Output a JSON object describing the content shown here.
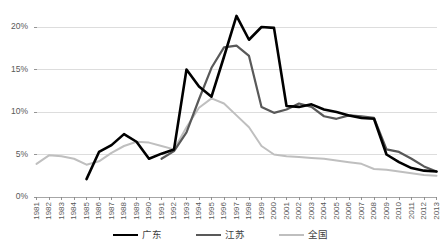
{
  "chart_data": {
    "type": "line",
    "title": "",
    "xlabel": "",
    "ylabel": "",
    "ylim": [
      0,
      21.5
    ],
    "ytick_values": [
      0,
      5,
      10,
      15,
      20
    ],
    "ytick_labels": [
      "0%",
      "5%",
      "10%",
      "15%",
      "20%"
    ],
    "grid": true,
    "legend_position": "bottom",
    "x": [
      1981,
      1982,
      1983,
      1984,
      1985,
      1986,
      1987,
      1988,
      1989,
      1990,
      1991,
      1992,
      1993,
      1994,
      1995,
      1996,
      1997,
      1998,
      1999,
      2000,
      2001,
      2002,
      2003,
      2004,
      2005,
      2006,
      2007,
      2008,
      2009,
      2010,
      2011,
      2012,
      2013
    ],
    "categories": [
      "1981",
      "1982",
      "1983",
      "1984",
      "1985",
      "1986",
      "1987",
      "1988",
      "1989",
      "1990",
      "1991",
      "1992",
      "1993",
      "1994",
      "1995",
      "1996",
      "1997",
      "1998",
      "1999",
      "2000",
      "2001",
      "2002",
      "2003",
      "2004",
      "2005",
      "2006",
      "2007",
      "2008",
      "2009",
      "2010",
      "2011",
      "2012",
      "2013"
    ],
    "series": [
      {
        "name": "广东",
        "color": "#000000",
        "width": 2.6,
        "start_index": 4,
        "values": [
          null,
          null,
          null,
          null,
          2.1,
          5.3,
          6.1,
          7.4,
          6.5,
          4.5,
          5.1,
          5.6,
          15.0,
          13.0,
          11.8,
          16.5,
          21.3,
          18.5,
          20.0,
          19.9,
          10.7,
          10.6,
          10.9,
          10.3,
          10.0,
          9.6,
          9.3,
          9.2,
          5.0,
          4.1,
          3.4,
          3.1,
          3.0
        ]
      },
      {
        "name": "江苏",
        "color": "#595959",
        "width": 2.2,
        "start_index": 10,
        "values": [
          null,
          null,
          null,
          null,
          null,
          null,
          null,
          null,
          null,
          null,
          4.5,
          5.4,
          7.6,
          11.5,
          15.2,
          17.6,
          17.8,
          16.6,
          10.6,
          9.9,
          10.3,
          11.0,
          10.6,
          9.5,
          9.2,
          9.6,
          9.5,
          9.3,
          5.6,
          5.3,
          4.5,
          3.6,
          3.0
        ]
      },
      {
        "name": "全国",
        "color": "#bfbfbf",
        "width": 2.0,
        "start_index": 0,
        "values": [
          3.9,
          4.9,
          4.8,
          4.5,
          3.8,
          4.2,
          5.2,
          6.0,
          6.5,
          6.4,
          6.0,
          5.6,
          8.2,
          10.5,
          11.6,
          11.0,
          9.6,
          8.2,
          6.0,
          5.0,
          4.8,
          4.7,
          4.6,
          4.5,
          4.3,
          4.1,
          3.9,
          3.3,
          3.2,
          3.0,
          2.8,
          2.6,
          2.5
        ]
      }
    ]
  },
  "legend": {
    "items": [
      {
        "label": "广东",
        "color": "#000000"
      },
      {
        "label": "江苏",
        "color": "#595959"
      },
      {
        "label": "全国",
        "color": "#bfbfbf"
      }
    ]
  },
  "axis": {
    "gridline_color": "#d9d9d9",
    "tick_color": "#898989",
    "label_color": "#595959"
  }
}
